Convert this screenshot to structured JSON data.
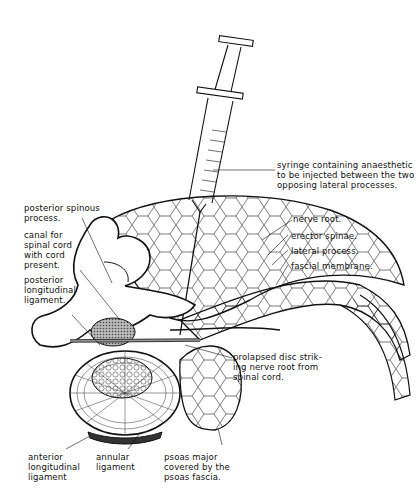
{
  "figure": {
    "colors": {
      "ink": "#111111",
      "background": "#ffffff",
      "shading": "#8a8a8a"
    }
  },
  "labels": {
    "syringe": "syringe containing anaesthetic\nto be injected between the two\nopposing lateral processes.",
    "nerve_root": "nerve root.",
    "erector_spinae": "erector spinae.",
    "lateral_process": "lateral process.",
    "fascial_membrane": "fascial membrane.",
    "posterior_spinous": "posterior spinous\nprocess.",
    "canal": "canal for\nspinal cord\nwith cord\npresent.",
    "posterior_longitudinal": "posterior\nlongitudinal\nligament.",
    "prolapsed_disc": "prolapsed disc strik-\ning nerve root from\nspinal cord.",
    "anterior_longitudinal": "anterior\nlongitudinal\nligament",
    "annular": "annular\nligament",
    "psoas": "psoas major\ncovered by the\npsoas fascia."
  }
}
